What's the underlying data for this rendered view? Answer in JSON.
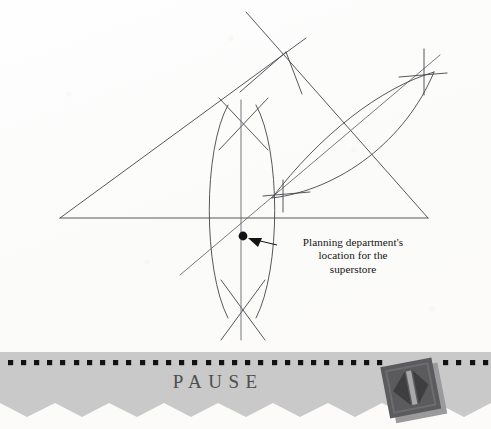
{
  "page": {
    "width": 491,
    "height": 429,
    "background_color": "#fdfdfc",
    "ink_color": "#3a3a3c",
    "text_color": "#161412"
  },
  "callout": {
    "line1": "Planning department's",
    "line2": "location for the",
    "line3": "superstore",
    "marker_label": "construction-point-dot",
    "marker_x": 243,
    "marker_y": 236
  },
  "construction": {
    "type": "compass-and-straightedge",
    "triangle": {
      "vertex_left_x": 60,
      "vertex_left_y": 218,
      "vertex_apex_x": 286,
      "vertex_apex_y": 52,
      "vertex_right_x": 428,
      "vertex_right_y": 218
    },
    "elements": [
      "triangle-base-line",
      "triangle-left-side",
      "triangle-right-side",
      "perpendicular-bisector-vertical",
      "perpendicular-bisector-diagonal",
      "arc-left-upper",
      "arc-left-lower",
      "arc-right-upper",
      "arc-right-lower",
      "intersection-point"
    ]
  },
  "banner": {
    "label": "PAUSE",
    "band_color": "#c9c9c9",
    "dot_color": "#121212",
    "dot_count": 36,
    "dot_size": 5,
    "dot_spacing": 13.2,
    "zigzag_peaks": 9,
    "text_color": "#4e4e4e",
    "button": {
      "name": "pause-next-button",
      "face_color": "#5a5a5c",
      "shadow_color": "#8e8e90",
      "glyph": "skip-back-triangle-bar-triangle",
      "rotation_deg": -11
    }
  }
}
